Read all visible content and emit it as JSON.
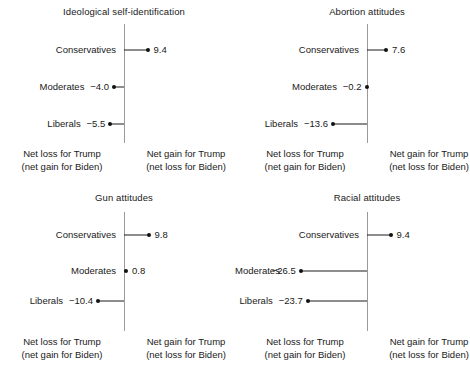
{
  "chart_data": {
    "type": "bar",
    "title": "",
    "xlabel": "",
    "ylabel": "",
    "orientation": "horizontal",
    "grid": false,
    "legend": false,
    "categories": [
      "Conservatives",
      "Moderates",
      "Liberals"
    ],
    "units": "net percentage-point change",
    "zero_axis": 0,
    "panels": [
      {
        "title": "Ideological self-identification",
        "values": [
          9.4,
          -4.0,
          -5.5
        ],
        "labels": [
          "9.4",
          "−4.0",
          "−5.5"
        ]
      },
      {
        "title": "Abortion attitudes",
        "values": [
          7.6,
          -0.2,
          -13.6
        ],
        "labels": [
          "7.6",
          "−0.2",
          "−13.6"
        ]
      },
      {
        "title": "Gun attitudes",
        "values": [
          9.8,
          0.8,
          -10.4
        ],
        "labels": [
          "9.8",
          "0.8",
          "−10.4"
        ]
      },
      {
        "title": "Racial attitudes",
        "values": [
          9.4,
          -26.5,
          -23.7
        ],
        "labels": [
          "9.4",
          "−26.5",
          "−23.7"
        ]
      }
    ],
    "footer_left_line1": "Net loss for Trump",
    "footer_left_line2": "(net gain for Biden)",
    "footer_right_line1": "Net gain for Trump",
    "footer_right_line2": "(net loss for Biden)",
    "colors": {
      "marker": "#111111",
      "stem": "#1d1d1d",
      "axis": "#9a9a9a",
      "text": "#1a1a1a",
      "background": "#ffffff"
    }
  }
}
